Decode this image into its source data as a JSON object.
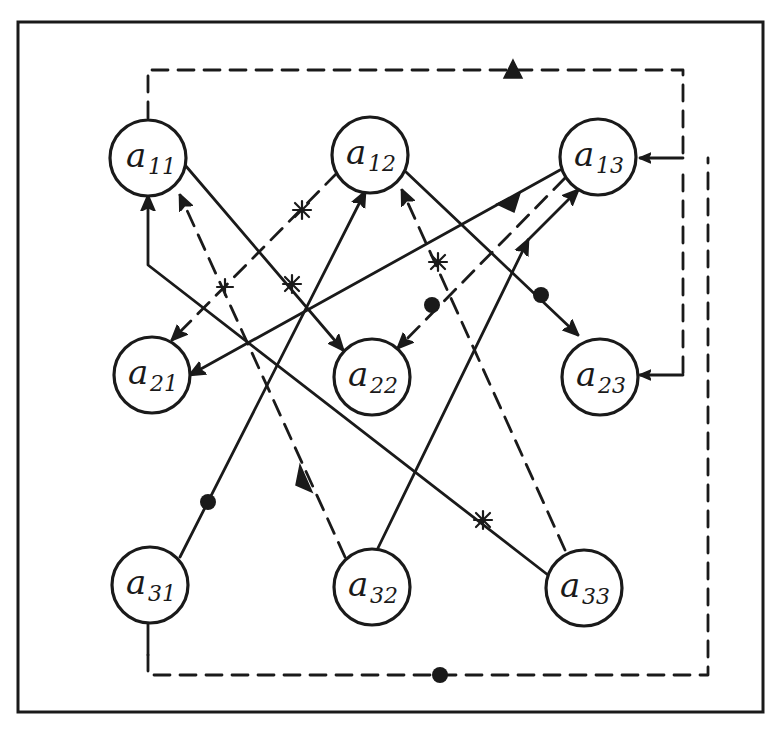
{
  "diagram": {
    "title": "",
    "style": "hand-drawn directed graph in a rectangular frame",
    "frame": {
      "x": 18,
      "y": 22,
      "width": 745,
      "height": 690
    },
    "node_radius": 38,
    "nodes": [
      {
        "id": "a11",
        "base": "a",
        "sub": "11",
        "x": 148,
        "y": 158
      },
      {
        "id": "a12",
        "base": "a",
        "sub": "12",
        "x": 370,
        "y": 155
      },
      {
        "id": "a13",
        "base": "a",
        "sub": "13",
        "x": 598,
        "y": 157
      },
      {
        "id": "a21",
        "base": "a",
        "sub": "21",
        "x": 152,
        "y": 375
      },
      {
        "id": "a22",
        "base": "a",
        "sub": "22",
        "x": 372,
        "y": 377
      },
      {
        "id": "a23",
        "base": "a",
        "sub": "23",
        "x": 600,
        "y": 377
      },
      {
        "id": "a31",
        "base": "a",
        "sub": "31",
        "x": 150,
        "y": 585
      },
      {
        "id": "a32",
        "base": "a",
        "sub": "32",
        "x": 372,
        "y": 587
      },
      {
        "id": "a33",
        "base": "a",
        "sub": "33",
        "x": 584,
        "y": 588
      }
    ],
    "edges": [
      {
        "id": "e1",
        "from": "a11",
        "to": "a22",
        "style": "solid",
        "marker": "asterisk"
      },
      {
        "id": "e2",
        "from": "a12",
        "to": "a21",
        "style": "dashed",
        "marker": "asterisk"
      },
      {
        "id": "e3",
        "from": "a12",
        "to": "a23",
        "style": "solid",
        "marker": "dot"
      },
      {
        "id": "e4",
        "from": "a13",
        "to": "a21",
        "style": "solid",
        "marker": "arrow"
      },
      {
        "id": "e5",
        "from": "a13",
        "to": "a22",
        "style": "dashed",
        "marker": "dot"
      },
      {
        "id": "e6",
        "from": "a32",
        "to": "a13",
        "style": "solid",
        "marker": "bidirectional"
      },
      {
        "id": "e7",
        "from": "a31",
        "to": "a12",
        "style": "solid",
        "marker": "dot"
      },
      {
        "id": "e8",
        "from": "a32",
        "to": "a11",
        "style": "dashed",
        "marker": "arrow"
      },
      {
        "id": "e9",
        "from": "a33",
        "to": "a11",
        "style": "solid",
        "marker": "asterisk",
        "via": [
          [
            148,
            265
          ]
        ]
      },
      {
        "id": "e10",
        "from": "a33",
        "to": "a12",
        "style": "dashed",
        "marker": "asterisk"
      },
      {
        "id": "e11",
        "from": "a11",
        "to": [
          "a13",
          "a23"
        ],
        "style": "dashed",
        "marker": "arrow",
        "route": "top loop"
      },
      {
        "id": "e12",
        "from": "a31",
        "to": "a13",
        "style": "dashed",
        "marker": "dot",
        "route": "bottom-right loop"
      }
    ]
  }
}
